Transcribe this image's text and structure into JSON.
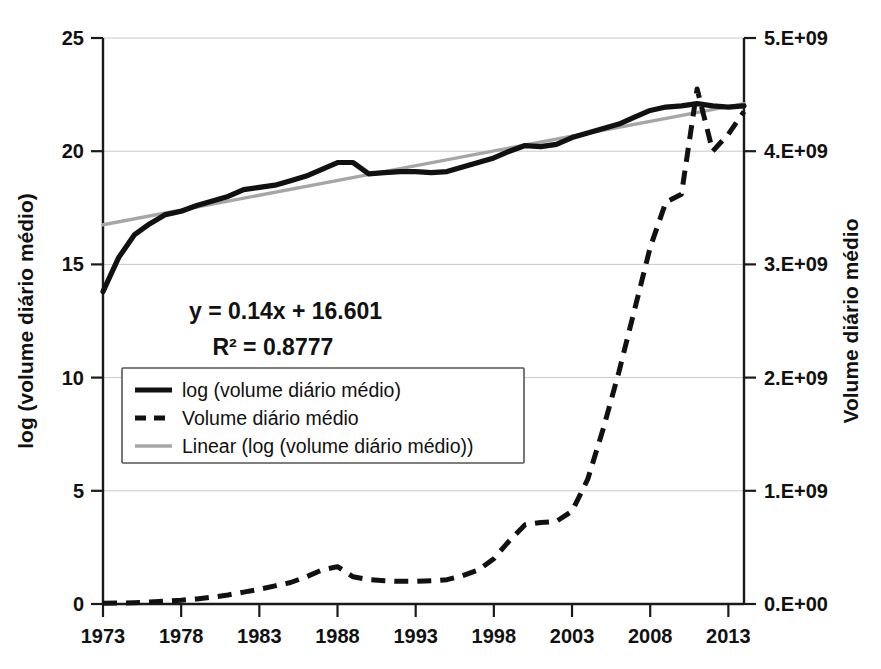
{
  "chart_data": {
    "type": "line",
    "title": "",
    "xlabel": "",
    "ylabel": "log (volume diário médio)",
    "y2label": "Volume diário médio",
    "xlim": [
      1973,
      2014
    ],
    "ylim": [
      0,
      25
    ],
    "y2lim": [
      0,
      5000000000
    ],
    "grid": true,
    "legend_position": "inside-left",
    "x_tick_labels": [
      "1973",
      "1978",
      "1983",
      "1988",
      "1993",
      "1998",
      "2003",
      "2008",
      "2013"
    ],
    "x_ticks": [
      1973,
      1978,
      1983,
      1988,
      1993,
      1998,
      2003,
      2008,
      2013
    ],
    "y_tick_labels": [
      "0",
      "5",
      "10",
      "15",
      "20",
      "25"
    ],
    "y_ticks": [
      0,
      5,
      10,
      15,
      20,
      25
    ],
    "y2_tick_labels": [
      "0.E+00",
      "1.E+09",
      "2.E+09",
      "3.E+09",
      "4.E+09",
      "5.E+09"
    ],
    "y2_ticks": [
      0,
      1000000000,
      2000000000,
      3000000000,
      4000000000,
      5000000000
    ],
    "annotations": [
      {
        "text": "y = 0.14x + 16.601",
        "x": 1978.5,
        "y": 12.6
      },
      {
        "text": "R² = 0.8777",
        "x": 1980.0,
        "y": 11.0
      }
    ],
    "x": [
      1973,
      1974,
      1975,
      1976,
      1977,
      1978,
      1979,
      1980,
      1981,
      1982,
      1983,
      1984,
      1985,
      1986,
      1987,
      1988,
      1989,
      1990,
      1991,
      1992,
      1993,
      1994,
      1995,
      1996,
      1997,
      1998,
      1999,
      2000,
      2001,
      2002,
      2003,
      2004,
      2005,
      2006,
      2007,
      2008,
      2009,
      2010,
      2011,
      2012,
      2013,
      2014
    ],
    "series": [
      {
        "name": "log (volume diário médio)",
        "axis": "left",
        "style": "solid",
        "color": "#111111",
        "values": [
          13.8,
          15.3,
          16.3,
          16.8,
          17.2,
          17.35,
          17.6,
          17.8,
          18.0,
          18.3,
          18.4,
          18.5,
          18.7,
          18.9,
          19.2,
          19.5,
          19.5,
          19.0,
          19.05,
          19.1,
          19.1,
          19.05,
          19.1,
          19.3,
          19.5,
          19.7,
          20.0,
          20.25,
          20.2,
          20.3,
          20.6,
          20.8,
          21.0,
          21.2,
          21.5,
          21.8,
          21.95,
          22.0,
          22.1,
          22.0,
          21.95,
          22.0
        ]
      },
      {
        "name": "Volume diário médio",
        "axis": "right",
        "style": "dashed",
        "color": "#111111",
        "values": [
          6000000,
          8000000,
          12000000,
          18000000,
          25000000,
          33000000,
          45000000,
          60000000,
          80000000,
          105000000,
          130000000,
          160000000,
          190000000,
          240000000,
          300000000,
          330000000,
          240000000,
          215000000,
          205000000,
          200000000,
          200000000,
          205000000,
          215000000,
          250000000,
          300000000,
          400000000,
          560000000,
          700000000,
          720000000,
          730000000,
          820000000,
          1100000000,
          1550000000,
          2050000000,
          2600000000,
          3150000000,
          3550000000,
          3620000000,
          4550000000,
          4000000000,
          4150000000,
          4350000000
        ]
      },
      {
        "name": "Linear (log (volume diário médio))",
        "axis": "left",
        "style": "trendline",
        "color": "#a6a6a6",
        "equation": "y = 0.14x + 16.601",
        "r_squared": "R² = 0.8777",
        "slope": 0.14,
        "intercept": 16.601,
        "endpoints": [
          {
            "x": 1973,
            "y": 16.75
          },
          {
            "x": 2014,
            "y": 22.1
          }
        ]
      }
    ],
    "legend": [
      {
        "label": "log (volume diário médio)",
        "style": "solid",
        "color": "#111111"
      },
      {
        "label": "Volume diário médio",
        "style": "dashed",
        "color": "#111111"
      },
      {
        "label": "Linear (log (volume diário médio))",
        "style": "solid-gray",
        "color": "#a6a6a6"
      }
    ]
  }
}
